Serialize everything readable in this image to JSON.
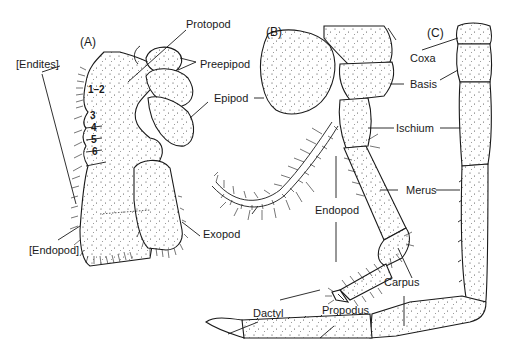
{
  "figure": {
    "panels": {
      "A": "(A)",
      "B": "(B)",
      "C": "(C)"
    },
    "panel_A": {
      "labels": {
        "protopod": "Protopod",
        "preepipod": "Preepipod",
        "epipod": "Epipod",
        "endites": "[Endites]",
        "endopod": "[Endopod]",
        "exopod": "Exopod"
      },
      "endite_numbers": [
        "1–2",
        "3",
        "4",
        "5",
        "6"
      ]
    },
    "panel_B": {
      "labels": {
        "epipod": "Epipod",
        "exopod": "Exopod",
        "endopod": "Endopod",
        "dactyl": "Dactyl",
        "propodus": "Propodus",
        "carpus": "Carpus"
      }
    },
    "shared_labels": {
      "coxa": "Coxa",
      "basis": "Basis",
      "ischium": "Ischium",
      "merus": "Merus"
    },
    "colors": {
      "ink": "#1a1a1a",
      "background": "#ffffff"
    }
  }
}
